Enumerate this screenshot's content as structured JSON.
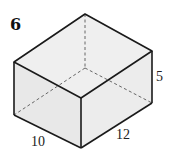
{
  "problem": {
    "number": "6"
  },
  "figure": {
    "type": "rectangular prism",
    "face_color": "#ececec",
    "edge_color": "#1a1a1a",
    "hidden_edge_color": "#555555",
    "dimensions": {
      "height": "5",
      "length": "12",
      "width": "10"
    }
  }
}
